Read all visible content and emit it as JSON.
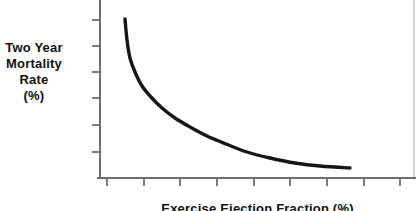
{
  "figure": {
    "background": "#ffffff"
  },
  "chart_data": {
    "type": "line",
    "title": "",
    "xlabel": "Exercise Ejection Fraction (%)",
    "ylabel": "Two Year Mortality Rate (%)",
    "ylabel_lines": [
      "Two Year",
      "Mortality",
      "Rate",
      "(%)"
    ],
    "x_axis": {
      "label": "Exercise Ejection Fraction (%)",
      "tick_count": 9,
      "tick_labels": [],
      "ticks_px": [
        107,
        144,
        180,
        217,
        254,
        290,
        327,
        364,
        400
      ]
    },
    "y_axis": {
      "label": "Two Year Mortality Rate (%)",
      "tick_count": 6,
      "tick_labels": [],
      "ticks_px": [
        20,
        46,
        72,
        98,
        125,
        152
      ]
    },
    "axes_px": {
      "y_axis_x": 100,
      "x_axis_y": 178,
      "x_start": 97,
      "x_end": 416,
      "y_top": 0,
      "right_border_x": 414,
      "tick_len": 8,
      "axis_width": 2,
      "curve_width": 3.4
    },
    "series": [
      {
        "name": "two_year_mortality_vs_exercise_ejection_fraction",
        "points_px": [
          [
            125,
            19
          ],
          [
            127,
            40
          ],
          [
            130,
            58
          ],
          [
            135,
            72
          ],
          [
            142,
            86
          ],
          [
            151,
            97
          ],
          [
            162,
            108
          ],
          [
            175,
            118
          ],
          [
            190,
            127
          ],
          [
            207,
            136
          ],
          [
            226,
            144
          ],
          [
            247,
            152
          ],
          [
            270,
            158
          ],
          [
            295,
            163
          ],
          [
            320,
            166
          ],
          [
            350,
            168
          ]
        ]
      }
    ],
    "colors": {
      "curve": "#161616",
      "axis": "#6e6e6e",
      "right_border": "#b0b0b0",
      "text": "#111111"
    }
  }
}
